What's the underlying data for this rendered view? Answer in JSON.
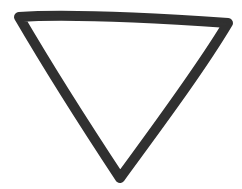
{
  "figure": {
    "description": "Hand-drawn inverted triangle outline",
    "shape": "inverted-triangle",
    "stroke_color": "#1e1e1e",
    "background_color": "#ffffff",
    "stroke_width": 10,
    "vertices": {
      "top_left": [
        18,
        16
      ],
      "top_right": [
        229,
        23
      ],
      "bottom": [
        120,
        179
      ]
    }
  }
}
